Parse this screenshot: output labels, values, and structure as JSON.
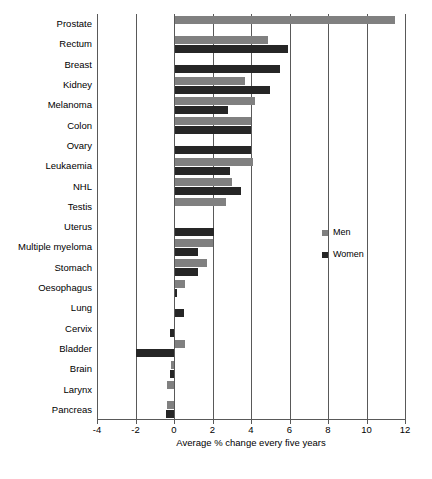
{
  "chart_data": {
    "type": "bar",
    "orientation": "horizontal",
    "title": "",
    "xlabel": "Average % change every five years",
    "ylabel": "",
    "xlim": [
      -4,
      12
    ],
    "xticks": [
      -4,
      -2,
      0,
      2,
      4,
      6,
      8,
      10,
      12
    ],
    "xtick_labels": [
      "-4",
      "-2",
      "0",
      "2",
      "4",
      "6",
      "8",
      "10",
      "12"
    ],
    "grid": "vertical",
    "legend_position": "middle-right",
    "categories": [
      "Prostate",
      "Rectum",
      "Breast",
      "Kidney",
      "Melanoma",
      "Colon",
      "Ovary",
      "Leukaemia",
      "NHL",
      "Testis",
      "Uterus",
      "Multiple myeloma",
      "Stomach",
      "Oesophagus",
      "Lung",
      "Cervix",
      "Bladder",
      "Brain",
      "Larynx",
      "Pancreas"
    ],
    "series": [
      {
        "name": "Men",
        "color": "#808080",
        "values": [
          11.5,
          4.9,
          null,
          3.7,
          4.2,
          4.0,
          null,
          4.1,
          3.0,
          2.7,
          null,
          2.0,
          1.7,
          0.55,
          null,
          null,
          0.55,
          -0.15,
          -0.35,
          -0.35
        ]
      },
      {
        "name": "Women",
        "color": "#262626",
        "values": [
          null,
          5.9,
          5.5,
          5.0,
          2.8,
          4.0,
          4.0,
          2.9,
          3.5,
          null,
          2.1,
          1.25,
          1.25,
          0.15,
          0.5,
          -0.2,
          -2.0,
          -0.2,
          null,
          -0.4
        ]
      }
    ]
  },
  "legend": {
    "items": [
      {
        "label": "Men",
        "color": "#808080"
      },
      {
        "label": "Women",
        "color": "#262626"
      }
    ]
  },
  "axis": {
    "x_title": "Average % change every five years"
  }
}
